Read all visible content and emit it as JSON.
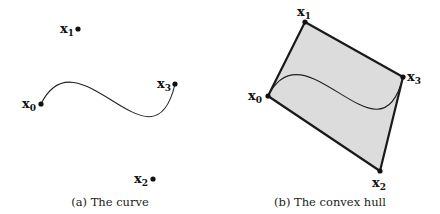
{
  "figure": {
    "panels": [
      {
        "id": "a",
        "caption": "(a) The curve",
        "caption_pos": [
          110,
          206
        ],
        "points": [
          {
            "name": "x",
            "sub": "0",
            "x": 41,
            "y": 104,
            "lx": 22,
            "ly": 108
          },
          {
            "name": "x",
            "sub": "1",
            "x": 78,
            "y": 29,
            "lx": 60,
            "ly": 33
          },
          {
            "name": "x",
            "sub": "2",
            "x": 153,
            "y": 179,
            "lx": 134,
            "ly": 183
          },
          {
            "name": "x",
            "sub": "3",
            "x": 175,
            "y": 84,
            "lx": 157,
            "ly": 88
          }
        ],
        "show_hull": false
      },
      {
        "id": "b",
        "caption": "(b) The convex hull",
        "caption_pos": [
          330,
          206
        ],
        "points": [
          {
            "name": "x",
            "sub": "0",
            "x": 268,
            "y": 96,
            "lx": 248,
            "ly": 100
          },
          {
            "name": "x",
            "sub": "1",
            "x": 305,
            "y": 22,
            "lx": 297,
            "ly": 16
          },
          {
            "name": "x",
            "sub": "2",
            "x": 380,
            "y": 171,
            "lx": 372,
            "ly": 187
          },
          {
            "name": "x",
            "sub": "3",
            "x": 403,
            "y": 77,
            "lx": 407,
            "ly": 81
          }
        ],
        "show_hull": true
      }
    ],
    "colors": {
      "hull_fill": "#dcdcdc",
      "hull_stroke": "#1a1a1a",
      "curve": "#222222",
      "point": "#111111"
    }
  }
}
